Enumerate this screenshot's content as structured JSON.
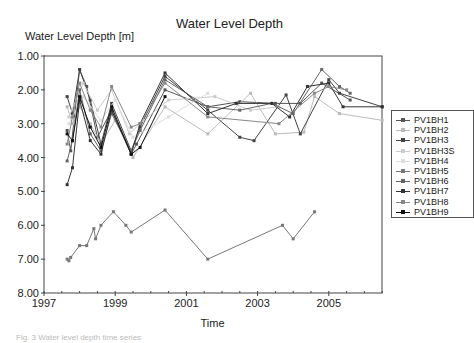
{
  "chart_data": {
    "type": "line",
    "title": "Water Level Depth",
    "ylabel": "Water Level Depth [m]",
    "xlabel": "Time",
    "ylim": [
      1.0,
      8.0
    ],
    "y_inverted": true,
    "xlim": [
      1997,
      2006.5
    ],
    "x_ticks": [
      "1997",
      "1999",
      "2001",
      "2003",
      "2005"
    ],
    "y_ticks": [
      "1.00",
      "2.00",
      "3.00",
      "4.00",
      "5.00",
      "6.00",
      "7.00",
      "8.00"
    ],
    "grid": false,
    "legend_position": "right",
    "series": [
      {
        "name": "PV1BH1",
        "color": "#555555",
        "points": [
          [
            1997.65,
            3.2
          ],
          [
            1997.75,
            3.8
          ],
          [
            1998.0,
            1.4
          ],
          [
            1998.2,
            1.9
          ],
          [
            1998.5,
            3.4
          ],
          [
            1998.9,
            2.6
          ],
          [
            1999.45,
            3.9
          ],
          [
            1999.6,
            3.6
          ],
          [
            2000.4,
            2.0
          ],
          [
            2001.6,
            2.5
          ],
          [
            2002.5,
            2.35
          ],
          [
            2003.5,
            2.4
          ],
          [
            2004.2,
            2.4
          ],
          [
            2004.8,
            1.8
          ],
          [
            2005.6,
            2.3
          ]
        ]
      },
      {
        "name": "PV1BH2",
        "color": "#bbbbbb",
        "points": [
          [
            1997.65,
            2.5
          ],
          [
            1997.8,
            3.0
          ],
          [
            1998.0,
            2.5
          ],
          [
            1998.3,
            3.0
          ],
          [
            1998.6,
            3.6
          ],
          [
            1999.0,
            2.9
          ],
          [
            1999.5,
            4.0
          ],
          [
            2000.4,
            2.5
          ],
          [
            2001.6,
            3.3
          ],
          [
            2002.8,
            2.1
          ],
          [
            2003.5,
            3.3
          ],
          [
            2004.3,
            3.25
          ],
          [
            2004.6,
            2.2
          ],
          [
            2005.3,
            2.7
          ],
          [
            2006.5,
            2.9
          ]
        ]
      },
      {
        "name": "PV1BH3",
        "color": "#444444",
        "points": [
          [
            1997.65,
            2.2
          ],
          [
            1997.8,
            2.7
          ],
          [
            1998.0,
            1.4
          ],
          [
            1998.3,
            2.3
          ],
          [
            1998.6,
            3.6
          ],
          [
            1998.9,
            2.4
          ],
          [
            1999.45,
            3.8
          ],
          [
            1999.7,
            3.1
          ],
          [
            2000.4,
            1.6
          ],
          [
            2001.6,
            2.6
          ],
          [
            2002.5,
            3.4
          ],
          [
            2002.9,
            3.5
          ],
          [
            2003.8,
            2.15
          ],
          [
            2004.2,
            3.3
          ],
          [
            2005.0,
            1.7
          ],
          [
            2005.3,
            2.1
          ],
          [
            2006.5,
            2.5
          ]
        ]
      },
      {
        "name": "PV1BH3S",
        "color": "#cccccc",
        "points": [
          [
            1997.7,
            2.8
          ],
          [
            1998.1,
            1.8
          ],
          [
            1998.5,
            2.6
          ],
          [
            1998.9,
            2.0
          ],
          [
            1999.4,
            3.3
          ],
          [
            1999.8,
            2.9
          ],
          [
            2000.5,
            2.3
          ],
          [
            2001.8,
            2.2
          ],
          [
            2002.8,
            2.6
          ],
          [
            2003.6,
            2.5
          ]
        ]
      },
      {
        "name": "PV1BH4",
        "color": "#dddddd",
        "points": [
          [
            1997.7,
            3.0
          ],
          [
            1998.1,
            2.2
          ],
          [
            1998.6,
            2.9
          ],
          [
            1999.0,
            2.3
          ],
          [
            1999.5,
            3.4
          ],
          [
            2000.5,
            2.8
          ],
          [
            2001.6,
            2.1
          ]
        ]
      },
      {
        "name": "PV1BH5",
        "color": "#777777",
        "points": [
          [
            1997.65,
            7.0
          ],
          [
            1997.7,
            7.05
          ],
          [
            1997.75,
            6.95
          ],
          [
            1998.0,
            6.6
          ],
          [
            1998.2,
            6.6
          ],
          [
            1998.4,
            6.1
          ],
          [
            1998.45,
            6.4
          ],
          [
            1998.6,
            6.0
          ],
          [
            1998.95,
            5.6
          ],
          [
            1999.3,
            6.0
          ],
          [
            1999.45,
            6.2
          ],
          [
            2000.4,
            5.55
          ],
          [
            2001.6,
            7.0
          ],
          [
            2003.7,
            6.0
          ],
          [
            2004.0,
            6.4
          ],
          [
            2004.6,
            5.6
          ]
        ]
      },
      {
        "name": "PV1BH6",
        "color": "#666666",
        "points": [
          [
            1997.65,
            4.1
          ],
          [
            1997.8,
            3.5
          ],
          [
            1998.0,
            2.0
          ],
          [
            1998.3,
            3.3
          ],
          [
            1998.6,
            3.8
          ],
          [
            1998.9,
            2.7
          ],
          [
            1999.45,
            3.8
          ],
          [
            1999.7,
            3.2
          ],
          [
            2000.4,
            1.7
          ],
          [
            2001.6,
            2.5
          ],
          [
            2002.5,
            2.6
          ],
          [
            2003.4,
            2.4
          ],
          [
            2004.0,
            2.7
          ],
          [
            2004.8,
            1.4
          ],
          [
            2005.3,
            1.9
          ],
          [
            2005.6,
            2.1
          ]
        ]
      },
      {
        "name": "PV1BH7",
        "color": "#333333",
        "points": [
          [
            1997.65,
            4.8
          ],
          [
            1997.8,
            4.3
          ],
          [
            1998.0,
            2.3
          ],
          [
            1998.3,
            3.5
          ],
          [
            1998.6,
            3.9
          ],
          [
            1998.9,
            2.6
          ],
          [
            1999.45,
            3.9
          ],
          [
            1999.7,
            3.0
          ],
          [
            2000.4,
            1.5
          ],
          [
            2001.6,
            2.7
          ],
          [
            2002.4,
            2.4
          ],
          [
            2003.4,
            2.4
          ],
          [
            2003.9,
            2.8
          ],
          [
            2004.4,
            1.9
          ],
          [
            2005.0,
            1.8
          ],
          [
            2005.4,
            2.5
          ],
          [
            2006.5,
            2.5
          ]
        ]
      },
      {
        "name": "PV1BH8",
        "color": "#888888",
        "points": [
          [
            1997.65,
            3.6
          ],
          [
            1997.8,
            2.8
          ],
          [
            1998.0,
            1.8
          ],
          [
            1998.3,
            2.6
          ],
          [
            1998.6,
            3.1
          ],
          [
            1998.9,
            1.9
          ],
          [
            1999.45,
            3.1
          ],
          [
            1999.7,
            3.0
          ],
          [
            2000.4,
            1.8
          ],
          [
            2001.6,
            2.8
          ],
          [
            2003.6,
            3.0
          ],
          [
            2004.6,
            2.1
          ],
          [
            2005.0,
            1.9
          ],
          [
            2005.5,
            2.0
          ]
        ]
      },
      {
        "name": "PV1BH9",
        "color": "#111111",
        "points": [
          [
            1997.65,
            3.3
          ],
          [
            1997.8,
            3.5
          ],
          [
            1998.0,
            2.2
          ],
          [
            1998.3,
            3.1
          ],
          [
            1998.6,
            3.7
          ],
          [
            1998.9,
            2.5
          ],
          [
            1999.45,
            3.9
          ],
          [
            1999.7,
            3.7
          ],
          [
            2000.4,
            2.2
          ]
        ]
      }
    ]
  },
  "caption": "Fig. 3  Water level depth time series"
}
